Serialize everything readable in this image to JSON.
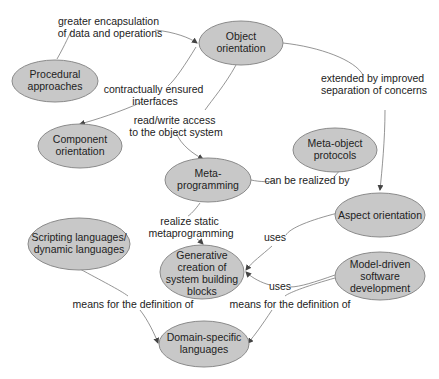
{
  "diagram": {
    "type": "concept-map",
    "colors": {
      "node_fill": "#c8c8c8",
      "node_stroke": "#8a8a8a",
      "edge": "#7a7a7a",
      "text": "#222222"
    },
    "nodes": {
      "object_orientation": {
        "lines": [
          "Object",
          "orientation"
        ]
      },
      "procedural": {
        "lines": [
          "Procedural",
          "approaches"
        ]
      },
      "component": {
        "lines": [
          "Component",
          "orientation"
        ]
      },
      "meta_object": {
        "lines": [
          "Meta-object",
          "protocols"
        ]
      },
      "metaprogramming": {
        "lines": [
          "Meta-",
          "programming"
        ]
      },
      "aspect": {
        "lines": [
          "Aspect orientation"
        ]
      },
      "scripting": {
        "lines": [
          "Scripting languages/",
          "dynamic languages"
        ]
      },
      "generative": {
        "lines": [
          "Generative",
          "creation of",
          "system building",
          "blocks"
        ]
      },
      "model_driven": {
        "lines": [
          "Model-driven",
          "software",
          "development"
        ]
      },
      "dsl": {
        "lines": [
          "Domain-specific",
          "languages"
        ]
      }
    },
    "edges": {
      "proc_to_oo": {
        "from": "Procedural approaches",
        "to": "Object orientation",
        "lines": [
          "greater encapsulation",
          "of data and operations"
        ]
      },
      "oo_to_comp": {
        "from": "Object orientation",
        "to": "Component orientation",
        "lines": [
          "contractually ensured",
          "interfaces"
        ]
      },
      "oo_to_meta": {
        "from": "Object orientation",
        "to": "Meta-programming",
        "lines": [
          "read/write access",
          "to the object system"
        ]
      },
      "oo_to_aspect": {
        "from": "Object orientation",
        "to": "Aspect orientation",
        "lines": [
          "extended by improved",
          "separation of concerns"
        ]
      },
      "meta_to_mop": {
        "from": "Meta-programming",
        "to": "Meta-object protocols",
        "lines": [
          "can be realized by"
        ]
      },
      "meta_to_gen": {
        "from": "Meta-programming",
        "to": "Generative creation of system building blocks",
        "lines": [
          "realize static",
          "metaprogramming"
        ]
      },
      "aspect_to_gen": {
        "from": "Aspect orientation",
        "to": "Generative creation of system building blocks",
        "lines": [
          "uses"
        ]
      },
      "mdsd_to_gen": {
        "from": "Model-driven software development",
        "to": "Generative creation of system building blocks",
        "lines": [
          "uses"
        ]
      },
      "script_to_dsl": {
        "from": "Scripting languages/dynamic languages",
        "to": "Domain-specific languages",
        "lines": [
          "means for the definition of"
        ]
      },
      "mdsd_to_dsl": {
        "from": "Model-driven software development",
        "to": "Domain-specific languages",
        "lines": [
          "means for the definition of"
        ]
      }
    }
  }
}
